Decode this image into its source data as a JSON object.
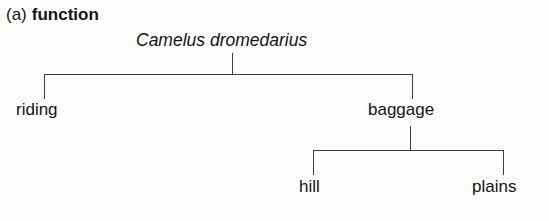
{
  "figure": {
    "caption": {
      "label": "(a)",
      "title": "function"
    },
    "type": "hierarchy-tree-diagram",
    "background_color": "#fdfdfc",
    "line_color": "#3c3c3c",
    "text_color": "#141414"
  },
  "tree": {
    "root": {
      "label": "Camelus dromedarius",
      "style": "italic"
    },
    "level1": [
      {
        "label": "riding"
      },
      {
        "label": "baggage"
      }
    ],
    "level2": [
      {
        "label": "hill"
      },
      {
        "label": "plains"
      }
    ]
  }
}
